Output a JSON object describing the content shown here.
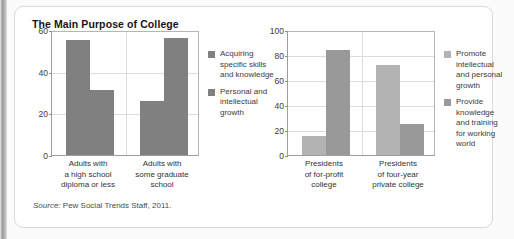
{
  "page": {
    "title": "The Main Purpose of College",
    "source_prefix": "Source:",
    "source_text": " Pew Social Trends Staff, 2011."
  },
  "colors": {
    "bar_dark": "#808080",
    "bar_mid": "#999999",
    "bar_light": "#b3b3b3",
    "axis": "#9d9d9d",
    "grid": "#dcdcdc",
    "card_border": "#d9d9d9"
  },
  "chart_data": [
    {
      "id": "left",
      "type": "bar",
      "title": "The Main Purpose of College",
      "xlabel": "",
      "ylabel": "",
      "ylim": [
        0,
        60
      ],
      "yticks": [
        0,
        20,
        40,
        60
      ],
      "ticklabels": [
        "0",
        "20",
        "40",
        "60"
      ],
      "grid": true,
      "legend_position": "right",
      "categories": [
        "Adults with a high school diploma or less",
        "Adults with some graduate school"
      ],
      "category_lines": [
        [
          "Adults with",
          "a high school",
          "diploma or less"
        ],
        [
          "Adults with",
          "some graduate",
          "school"
        ]
      ],
      "series": [
        {
          "name": "Acquiring specific skills and knowledge",
          "name_lines": [
            "Acquiring",
            "specific skills",
            "and knowledge"
          ],
          "color": "#808080",
          "values": [
            55,
            26
          ]
        },
        {
          "name": "Personal and intellectual growth",
          "name_lines": [
            "Personal and",
            "intellectual",
            "growth"
          ],
          "color": "#808080",
          "values": [
            31,
            56
          ]
        }
      ]
    },
    {
      "id": "right",
      "type": "bar",
      "title": "",
      "xlabel": "",
      "ylabel": "",
      "ylim": [
        0,
        100
      ],
      "yticks": [
        0,
        20,
        40,
        60,
        80,
        100
      ],
      "ticklabels": [
        "0",
        "20",
        "40",
        "60",
        "80",
        "100"
      ],
      "grid": true,
      "legend_position": "right",
      "categories": [
        "Presidents of for-profit college",
        "Presidents of four-year private college"
      ],
      "category_lines": [
        [
          "Presidents",
          "of for-profit",
          "college"
        ],
        [
          "Presidents",
          "of four-year",
          "private college"
        ]
      ],
      "series": [
        {
          "name": "Promote intellectual and personal growth",
          "name_lines": [
            "Promote",
            "intellectual",
            "and personal",
            "growth"
          ],
          "color": "#b3b3b3",
          "values": [
            15,
            72
          ]
        },
        {
          "name": "Provide knowledge and training for working world",
          "name_lines": [
            "Provide",
            "knowledge",
            "and training",
            "for working",
            "world"
          ],
          "color": "#999999",
          "values": [
            84,
            25
          ]
        }
      ]
    }
  ]
}
